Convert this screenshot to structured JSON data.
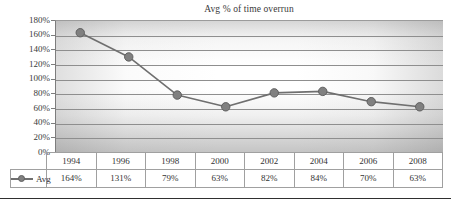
{
  "chart_data": {
    "type": "line",
    "title": "Avg % of time overrun",
    "xlabel": "",
    "ylabel": "",
    "categories": [
      "1994",
      "1996",
      "1998",
      "2000",
      "2002",
      "2004",
      "2006",
      "2008"
    ],
    "series": [
      {
        "name": "Avg",
        "values": [
          164,
          131,
          79,
          63,
          82,
          84,
          70,
          63
        ],
        "value_labels": [
          "164%",
          "131%",
          "79%",
          "63%",
          "82%",
          "84%",
          "70%",
          "63%"
        ],
        "marker": "circle",
        "color": "#808080",
        "line_color": "#6f6f6f"
      }
    ],
    "ylim": [
      0,
      180
    ],
    "ytick_values": [
      180,
      160,
      140,
      120,
      100,
      80,
      60,
      40,
      20,
      0
    ],
    "ytick_labels": [
      "180%",
      "160%",
      "140%",
      "120%",
      "100%",
      "80%",
      "60%",
      "40%",
      "20%",
      "0%"
    ],
    "grid": true,
    "grid_axis": "y",
    "legend_position": "data-table-row",
    "data_table": {
      "visible": true,
      "header": [
        "1994",
        "1996",
        "1998",
        "2000",
        "2002",
        "2004",
        "2006",
        "2008"
      ],
      "rows": [
        {
          "label": "Avg",
          "marker_icon": "line-circle-marker-icon",
          "cells": [
            "164%",
            "131%",
            "79%",
            "63%",
            "82%",
            "84%",
            "70%",
            "63%"
          ]
        }
      ]
    },
    "colors": {
      "series": "#808080",
      "line": "#6f6f6f",
      "gridline": "#8e8e8e",
      "axis": "#7d7d7d",
      "text": "#3a3a3a",
      "table_border": "#a0a0a0",
      "bottom_rule": "#2f2f2f"
    }
  }
}
